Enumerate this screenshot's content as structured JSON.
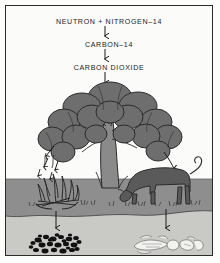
{
  "figure": {
    "frame_border_color": "#2b2b2b",
    "background_color": "#fbfbfa"
  },
  "equation_chain": {
    "step1": "NEUTRON  +  NITROGEN–14",
    "step2": "CARBON–14",
    "step3": "CARBON  DIOXIDE",
    "arrow_symbol": "↓",
    "arrow_count": 3
  },
  "scene": {
    "sky": {
      "name": "sky",
      "color": "#fbfbfa"
    },
    "soil": {
      "name": "soil-layer",
      "color": "#8e8e8e",
      "top": 178,
      "bottom": 214
    },
    "subsoil": {
      "name": "subsoil-layer",
      "color": "#c9c9c6",
      "top": 214,
      "bottom": 251
    },
    "tree": {
      "name": "tree",
      "canopy_color": "#6e6e6e",
      "trunk_color": "#8a8a8a",
      "outline_color": "#2b2b2b"
    },
    "campfire": {
      "name": "campfire",
      "color": "#3a3a3a",
      "smoke": "rising smoke"
    },
    "cow": {
      "name": "grazing-cow",
      "color": "#5a5a5a"
    },
    "coal": {
      "name": "coal-deposit",
      "color": "#111111",
      "chunk_count": 34
    },
    "fossil": {
      "name": "fossil-bones",
      "color": "#f2f2ef"
    },
    "grass": {
      "name": "grass-tufts",
      "color": "#4a4a4a"
    }
  },
  "flow_arrows": {
    "tree_to_fire": "downward arrows from tree to campfire",
    "tree_to_cow": "downward arrow from tree to cow",
    "fire_to_coal": "downward arrow from campfire to coal deposit",
    "cow_to_fossil": "downward arrow from cow to fossil bones"
  }
}
